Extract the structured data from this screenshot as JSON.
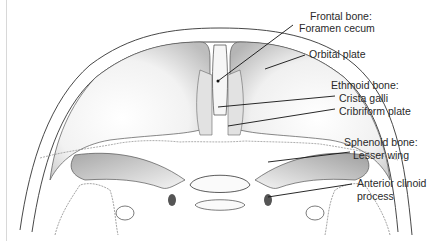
{
  "diagram": {
    "labels": [
      {
        "id": "frontal-bone",
        "group": "Frontal bone:",
        "part": "Foramen cecum"
      },
      {
        "id": "orbital-plate",
        "part": "Orbital plate"
      },
      {
        "id": "ethmoid-bone",
        "group": "Ethmoid bone:",
        "parts": [
          "Crista galli",
          "Cribriform plate"
        ]
      },
      {
        "id": "sphenoid-bone",
        "group": "Sphenoid bone:",
        "part": "Lesser wing"
      },
      {
        "id": "anterior-clinoid",
        "part_line1": "Anterior clinoid",
        "part_line2": "process"
      }
    ],
    "colors": {
      "line": "#1a1a1a",
      "bone_shade": "#bdbdbd",
      "background": "#ffffff",
      "text": "#2a2a2a"
    }
  }
}
